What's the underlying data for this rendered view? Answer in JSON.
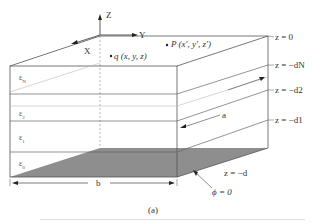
{
  "figure": {
    "caption": "(a)",
    "axes": {
      "z": "Z",
      "y": "Y",
      "x": "X"
    },
    "points": {
      "q": "q (x, y, z)",
      "p": "P (x′, y′, z′)"
    },
    "layers": [
      {
        "label": "εN",
        "sub": "N"
      },
      {
        "label": "ε2",
        "sub": "2"
      },
      {
        "label": "ε1",
        "sub": "1"
      },
      {
        "label": "ε0",
        "sub": "0"
      }
    ],
    "boundaries": [
      "z = 0",
      "z = −dN",
      "z = −d2",
      "z = −d1",
      "z = −d"
    ],
    "dimensions": {
      "width": "b",
      "depth": "a"
    },
    "ground_label": "ϕ = 0",
    "colors": {
      "line": "#555555",
      "light_line": "#bbbbbb",
      "ground": "#8a8a8a"
    }
  }
}
